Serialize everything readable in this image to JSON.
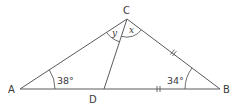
{
  "diagram": {
    "type": "triangle",
    "points": {
      "A": {
        "label": "A"
      },
      "B": {
        "label": "B"
      },
      "C": {
        "label": "C"
      },
      "D": {
        "label": "D"
      }
    },
    "segments": [
      "AB",
      "AC",
      "CB",
      "CD"
    ],
    "angles": {
      "A": {
        "label": "38°"
      },
      "B": {
        "label": "34°"
      },
      "ACD": {
        "label": "y"
      },
      "DCB": {
        "label": "x"
      }
    },
    "equal_marks": {
      "CB": "||",
      "DB": "||"
    },
    "colors": {
      "stroke": "#5a5a5a",
      "text": "#3a3a3a"
    }
  }
}
